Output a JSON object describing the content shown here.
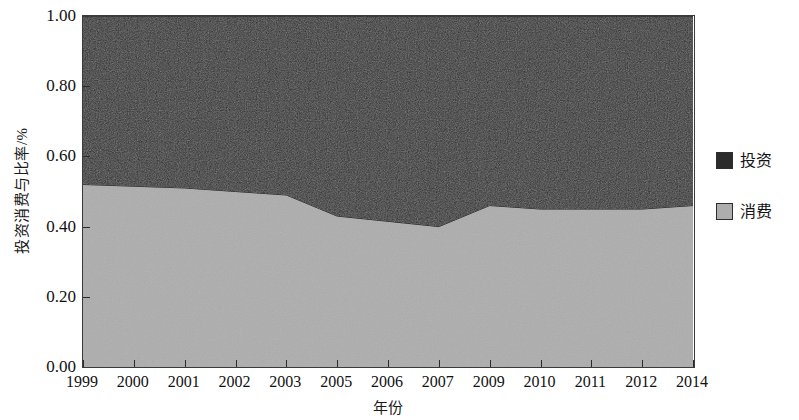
{
  "chart_data": {
    "type": "area",
    "title": "",
    "xlabel": "年份",
    "ylabel": "投资消费与比率/%",
    "stacked": true,
    "grid": false,
    "legend_position": "right",
    "ylim": [
      0.0,
      1.0
    ],
    "yticks": [
      "0.00",
      "0.20",
      "0.40",
      "0.60",
      "0.80",
      "1.00"
    ],
    "ytick_values": [
      0.0,
      0.2,
      0.4,
      0.6,
      0.8,
      1.0
    ],
    "categories": [
      "1999",
      "2000",
      "2001",
      "2002",
      "2003",
      "2005",
      "2006",
      "2007",
      "2009",
      "2010",
      "2011",
      "2012",
      "2014"
    ],
    "series": [
      {
        "name": "消费",
        "color": "#adadad",
        "values": [
          0.52,
          0.515,
          0.51,
          0.5,
          0.49,
          0.43,
          0.415,
          0.4,
          0.46,
          0.45,
          0.45,
          0.45,
          0.46
        ]
      },
      {
        "name": "投资",
        "color": "#2b2b2b",
        "values": [
          0.48,
          0.485,
          0.49,
          0.5,
          0.51,
          0.57,
          0.585,
          0.6,
          0.54,
          0.55,
          0.55,
          0.55,
          0.54
        ]
      }
    ]
  },
  "legend": {
    "entries": [
      {
        "label": "投资",
        "swatch": "#2b2b2b"
      },
      {
        "label": "消费",
        "swatch": "#adadad"
      }
    ]
  },
  "axes": {
    "y_title": "投资消费与比率/%",
    "x_title": "年份"
  }
}
